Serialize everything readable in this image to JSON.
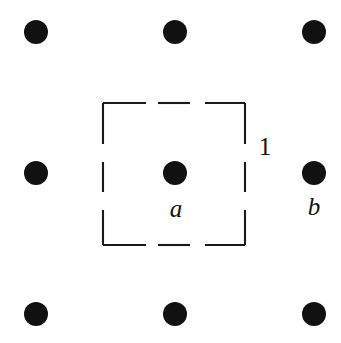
{
  "figure": {
    "kind": "lattice-unit-cell-diagram",
    "width": 341,
    "height": 343,
    "background_color": "#ffffff",
    "ink_color": "#111111"
  },
  "lattice": {
    "dot_color": "#111111",
    "dot_radius": 12,
    "columns_x": [
      36,
      175,
      314
    ],
    "rows_y": [
      32,
      173,
      314
    ],
    "spacing": 139,
    "points": [
      {
        "name": "dot-top-left",
        "cx": 36,
        "cy": 32,
        "label": ""
      },
      {
        "name": "dot-top-center",
        "cx": 175,
        "cy": 32,
        "label": ""
      },
      {
        "name": "dot-top-right",
        "cx": 314,
        "cy": 32,
        "label": ""
      },
      {
        "name": "dot-middle-left",
        "cx": 36,
        "cy": 173,
        "label": ""
      },
      {
        "name": "dot-center",
        "cx": 175,
        "cy": 173,
        "label": "a"
      },
      {
        "name": "dot-middle-right",
        "cx": 314,
        "cy": 173,
        "label": "b"
      },
      {
        "name": "dot-bottom-left",
        "cx": 36,
        "cy": 314,
        "label": ""
      },
      {
        "name": "dot-bottom-center",
        "cx": 175,
        "cy": 314,
        "label": ""
      },
      {
        "name": "dot-bottom-right",
        "cx": 314,
        "cy": 314,
        "label": ""
      }
    ]
  },
  "unit_cell": {
    "stroke_color": "#1a1a1a",
    "stroke_width": 2.1,
    "left": 103,
    "top": 103,
    "right": 245,
    "bottom": 245,
    "side_length": 142,
    "dashes_per_edge": 3,
    "dash_length": 38,
    "gap_length": 14,
    "edges": {
      "top": [
        {
          "x1": 103,
          "y1": 103,
          "x2": 146,
          "y2": 103
        },
        {
          "x1": 158,
          "y1": 103,
          "x2": 190,
          "y2": 103
        },
        {
          "x1": 205,
          "y1": 103,
          "x2": 245,
          "y2": 103
        }
      ],
      "right": [
        {
          "x1": 245,
          "y1": 103,
          "x2": 245,
          "y2": 144
        },
        {
          "x1": 245,
          "y1": 162,
          "x2": 245,
          "y2": 192
        },
        {
          "x1": 245,
          "y1": 210,
          "x2": 245,
          "y2": 245
        }
      ],
      "bottom": [
        {
          "x1": 103,
          "y1": 245,
          "x2": 146,
          "y2": 245
        },
        {
          "x1": 158,
          "y1": 245,
          "x2": 190,
          "y2": 245
        },
        {
          "x1": 205,
          "y1": 245,
          "x2": 245,
          "y2": 245
        }
      ],
      "left": [
        {
          "x1": 103,
          "y1": 103,
          "x2": 103,
          "y2": 144
        },
        {
          "x1": 103,
          "y1": 162,
          "x2": 103,
          "y2": 192
        },
        {
          "x1": 103,
          "y1": 210,
          "x2": 103,
          "y2": 245
        }
      ]
    }
  },
  "labels": {
    "point_a": {
      "text": "a",
      "x": 176,
      "y": 217,
      "style": "italic"
    },
    "point_b": {
      "text": "b",
      "x": 314,
      "y": 215,
      "style": "italic"
    },
    "side_length": {
      "text": "1",
      "x": 265,
      "y": 155,
      "style": "upright"
    }
  }
}
